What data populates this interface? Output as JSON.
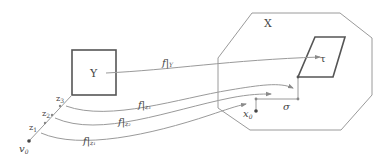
{
  "diagram": {
    "type": "commutative-mapping-diagram",
    "colors": {
      "stroke": "#8a8a8a",
      "thick_stroke": "#555555",
      "text": "#444444",
      "point": "#444444"
    },
    "space_X": {
      "label": "X",
      "shape": "octagon",
      "points": [
        [
          252,
          13
        ],
        [
          340,
          13
        ],
        [
          372,
          38
        ],
        [
          372,
          95
        ],
        [
          341,
          130
        ],
        [
          250,
          130
        ],
        [
          218,
          108
        ],
        [
          218,
          58
        ]
      ]
    },
    "space_Y": {
      "label": "Y",
      "shape": "square",
      "x": 72,
      "y": 50,
      "width": 44,
      "height": 45
    },
    "cell_tau": {
      "label": "τ",
      "shape": "parallelogram",
      "points": [
        [
          315,
          37
        ],
        [
          345,
          37
        ],
        [
          333,
          77
        ],
        [
          298,
          77
        ]
      ]
    },
    "path_sigma": {
      "label": "σ",
      "points": [
        [
          256,
          111
        ],
        [
          256,
          99
        ],
        [
          298,
          99
        ],
        [
          298,
          77
        ]
      ]
    },
    "point_x0": {
      "label": "x",
      "sub": "0",
      "x": 256,
      "y": 111
    },
    "point_v0": {
      "label": "v",
      "sub": "0",
      "x": 29,
      "y": 141
    },
    "segment_points": [
      {
        "label": "z",
        "sub": "1",
        "x": 45,
        "y": 123
      },
      {
        "label": "z",
        "sub": "2",
        "x": 52,
        "y": 114
      },
      {
        "label": "z",
        "sub": "3",
        "x": 60,
        "y": 105
      }
    ],
    "maps": [
      {
        "label": "f|",
        "sub": "Y",
        "from": [
          106,
          73
        ],
        "to": [
          320,
          57
        ],
        "label_pos": [
          162,
          67
        ]
      },
      {
        "label": "f|",
        "sub": "z₃",
        "from": [
          66,
          105
        ],
        "to": [
          293,
          88
        ],
        "label_pos": [
          138,
          108
        ]
      },
      {
        "label": "f|",
        "sub": "z₂",
        "from": [
          55,
          118
        ],
        "to": [
          271,
          93
        ],
        "label_pos": [
          118,
          126
        ]
      },
      {
        "label": "f|",
        "sub": "z₁",
        "from": [
          41,
          132
        ],
        "to": [
          246,
          103
        ],
        "label_pos": [
          83,
          145
        ]
      }
    ]
  }
}
